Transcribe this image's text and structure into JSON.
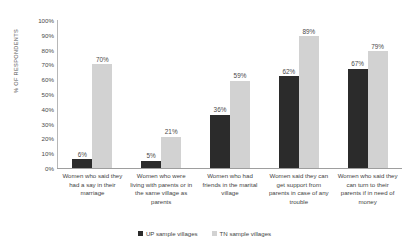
{
  "chart_data": {
    "type": "bar",
    "title": "",
    "subtitle": "",
    "xlabel": "",
    "ylabel": "% OF RESPONDENTS",
    "ylim": [
      0,
      100
    ],
    "grid": false,
    "legend_position": "bottom",
    "y_ticks": [
      "0%",
      "10%",
      "20%",
      "30%",
      "40%",
      "50%",
      "60%",
      "70%",
      "80%",
      "90%",
      "100%"
    ],
    "categories": [
      "Women who said they had a say in their marriage",
      "Women who were living with parents or in the same village as parents",
      "Women who had friends in the marital village",
      "Women said they can get support from parents in case of any trouble",
      "Women who said they can turn to their parents if in need of money"
    ],
    "series": [
      {
        "name": "UP sample villages",
        "color": "#2b2b2b",
        "values": [
          6,
          5,
          36,
          62,
          67
        ],
        "data_labels": [
          "6%",
          "5%",
          "36%",
          "62%",
          "67%"
        ]
      },
      {
        "name": "TN sample villages",
        "color": "#d2d2d2",
        "values": [
          70,
          21,
          59,
          89,
          79
        ],
        "data_labels": [
          "70%",
          "21%",
          "59%",
          "89%",
          "79%"
        ]
      }
    ]
  }
}
